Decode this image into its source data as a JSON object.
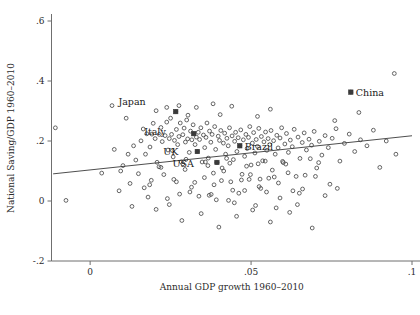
{
  "chart_data": {
    "type": "scatter",
    "title": "",
    "xlabel": "Annual GDP growth 1960–2010",
    "ylabel": "National Saving/GDP 1960–2010",
    "xlim": [
      -0.012,
      0.1
    ],
    "ylim": [
      -0.2,
      0.62
    ],
    "grid": false,
    "legend": "none",
    "xticks": [
      0,
      0.05,
      0.1
    ],
    "xtick_labels": [
      "0",
      ".05",
      ".1"
    ],
    "yticks": [
      -0.2,
      0,
      0.2,
      0.4,
      0.6
    ],
    "ytick_labels": [
      "-.2",
      "0",
      ".2",
      ".4",
      ".6"
    ],
    "marker_color": "#4a4a4a",
    "line_color": "#3a3a3a",
    "fit_line": {
      "x0": -0.0115,
      "y0": 0.0905,
      "x1": 0.1,
      "y1": 0.2175,
      "slope": 1.14,
      "intercept": 0.1036
    },
    "annotations": [
      {
        "label": "Japan",
        "x": 0.0266,
        "y": 0.298,
        "dx": -30,
        "dy": -10
      },
      {
        "label": "Italy",
        "x": 0.0322,
        "y": 0.2245,
        "dx": -28,
        "dy": -2
      },
      {
        "label": "UK",
        "x": 0.0333,
        "y": 0.165,
        "dx": -19,
        "dy": 0
      },
      {
        "label": "USA",
        "x": 0.0394,
        "y": 0.1285,
        "dx": -23,
        "dy": 2
      },
      {
        "label": "Brazil",
        "x": 0.0465,
        "y": 0.184,
        "dx": 5,
        "dy": 1
      },
      {
        "label": "China",
        "x": 0.081,
        "y": 0.363,
        "dx": 5,
        "dy": 1
      }
    ],
    "points": [
      [
        -0.0108,
        0.244
      ],
      [
        -0.0075,
        0.002
      ],
      [
        0.0036,
        0.093
      ],
      [
        0.0068,
        0.318
      ],
      [
        0.0075,
        0.172
      ],
      [
        0.009,
        0.034
      ],
      [
        0.0095,
        0.1
      ],
      [
        0.0112,
        0.276
      ],
      [
        0.0118,
        0.156
      ],
      [
        0.0124,
        0.0585
      ],
      [
        0.013,
        -0.018
      ],
      [
        0.0142,
        0.1365
      ],
      [
        0.015,
        0.091
      ],
      [
        0.0158,
        0.2005
      ],
      [
        0.0165,
        0.24
      ],
      [
        0.0172,
        0.156
      ],
      [
        0.018,
        0.013
      ],
      [
        0.0186,
        0.18
      ],
      [
        0.0192,
        0.223
      ],
      [
        0.0196,
        0.259
      ],
      [
        0.0202,
        0.208
      ],
      [
        0.0208,
        0.129
      ],
      [
        0.0215,
        0.222
      ],
      [
        0.022,
        0.245
      ],
      [
        0.0224,
        0.198
      ],
      [
        0.0229,
        0.088
      ],
      [
        0.0233,
        0.218
      ],
      [
        0.0238,
        0.263
      ],
      [
        0.0242,
        0.17
      ],
      [
        0.0246,
        0.208
      ],
      [
        0.025,
        0.276
      ],
      [
        0.0253,
        0.222
      ],
      [
        0.0258,
        0.147
      ],
      [
        0.0262,
        0.202
      ],
      [
        0.0266,
        0.298
      ],
      [
        0.0268,
        0.2385
      ],
      [
        0.0272,
        0.188
      ],
      [
        0.0276,
        0.215
      ],
      [
        0.028,
        0.26
      ],
      [
        0.0283,
        0.13
      ],
      [
        0.0288,
        0.221
      ],
      [
        0.0292,
        0.243
      ],
      [
        0.0296,
        0.1965
      ],
      [
        0.03,
        0.27
      ],
      [
        0.0303,
        0.207
      ],
      [
        0.0308,
        0.162
      ],
      [
        0.0312,
        0.233
      ],
      [
        0.0316,
        0.204
      ],
      [
        0.032,
        0.254
      ],
      [
        0.0322,
        0.2245
      ],
      [
        0.0326,
        0.188
      ],
      [
        0.033,
        0.213
      ],
      [
        0.0333,
        0.165
      ],
      [
        0.0336,
        0.229
      ],
      [
        0.034,
        0.205
      ],
      [
        0.0344,
        0.244
      ],
      [
        0.0348,
        0.13
      ],
      [
        0.0352,
        0.22
      ],
      [
        0.0356,
        0.178
      ],
      [
        0.036,
        0.212
      ],
      [
        0.0363,
        0.26
      ],
      [
        0.0367,
        0.143
      ],
      [
        0.0371,
        0.233
      ],
      [
        0.0375,
        0.196
      ],
      [
        0.0379,
        0.222
      ],
      [
        0.0383,
        0.093
      ],
      [
        0.0387,
        0.248
      ],
      [
        0.039,
        0.172
      ],
      [
        0.0394,
        0.1285
      ],
      [
        0.0398,
        0.216
      ],
      [
        0.0402,
        0.202
      ],
      [
        0.0406,
        0.235
      ],
      [
        0.041,
        0.11
      ],
      [
        0.0414,
        0.193
      ],
      [
        0.0418,
        0.226
      ],
      [
        0.0421,
        0.156
      ],
      [
        0.0425,
        0.209
      ],
      [
        0.0429,
        0.184
      ],
      [
        0.0433,
        0.244
      ],
      [
        0.0437,
        0.064
      ],
      [
        0.0441,
        0.217
      ],
      [
        0.0445,
        0.138
      ],
      [
        0.0449,
        0.199
      ],
      [
        0.0452,
        0.229
      ],
      [
        0.0456,
        0.165
      ],
      [
        0.046,
        0.211
      ],
      [
        0.0465,
        0.184
      ],
      [
        0.0468,
        0.237
      ],
      [
        0.0472,
        0.089
      ],
      [
        0.0476,
        0.204
      ],
      [
        0.048,
        0.149
      ],
      [
        0.0484,
        0.222
      ],
      [
        0.0488,
        0.175
      ],
      [
        0.0492,
        0.212
      ],
      [
        0.0496,
        0.248
      ],
      [
        0.05,
        0.12
      ],
      [
        0.0504,
        0.193
      ],
      [
        0.0508,
        0.228
      ],
      [
        0.0512,
        0.16
      ],
      [
        0.0516,
        0.205
      ],
      [
        0.052,
        0.182
      ],
      [
        0.0524,
        0.242
      ],
      [
        0.0528,
        0.073
      ],
      [
        0.0532,
        0.215
      ],
      [
        0.0536,
        0.134
      ],
      [
        0.054,
        0.197
      ],
      [
        0.0545,
        0.23
      ],
      [
        0.0549,
        0.169
      ],
      [
        0.0553,
        0.208
      ],
      [
        0.0558,
        0.188
      ],
      [
        0.0562,
        0.235
      ],
      [
        0.0566,
        0.103
      ],
      [
        0.057,
        0.201
      ],
      [
        0.0575,
        0.156
      ],
      [
        0.058,
        0.219
      ],
      [
        0.0584,
        0.177
      ],
      [
        0.059,
        0.21
      ],
      [
        0.0595,
        0.244
      ],
      [
        0.06,
        0.128
      ],
      [
        0.0605,
        0.19
      ],
      [
        0.061,
        0.225
      ],
      [
        0.0616,
        0.162
      ],
      [
        0.0622,
        0.203
      ],
      [
        0.0628,
        0.181
      ],
      [
        0.0634,
        0.239
      ],
      [
        0.064,
        0.082
      ],
      [
        0.0646,
        0.213
      ],
      [
        0.0652,
        0.142
      ],
      [
        0.0659,
        0.195
      ],
      [
        0.0665,
        0.227
      ],
      [
        0.0672,
        0.17
      ],
      [
        0.068,
        0.206
      ],
      [
        0.0688,
        0.186
      ],
      [
        0.0696,
        0.232
      ],
      [
        0.0704,
        0.11
      ],
      [
        0.0712,
        0.199
      ],
      [
        0.072,
        0.153
      ],
      [
        0.073,
        0.218
      ],
      [
        0.074,
        0.178
      ],
      [
        0.0752,
        0.209
      ],
      [
        0.0764,
        0.241
      ],
      [
        0.0776,
        0.133
      ],
      [
        0.079,
        0.192
      ],
      [
        0.0805,
        0.223
      ],
      [
        0.081,
        0.363
      ],
      [
        0.0822,
        0.165
      ],
      [
        0.084,
        0.204
      ],
      [
        0.086,
        0.184
      ],
      [
        0.088,
        0.236
      ],
      [
        0.09,
        0.112
      ],
      [
        0.092,
        0.2
      ],
      [
        0.0945,
        0.425
      ],
      [
        0.095,
        0.156
      ],
      [
        0.0168,
        0.044
      ],
      [
        0.0205,
        -0.028
      ],
      [
        0.024,
        0.008
      ],
      [
        0.0285,
        -0.065
      ],
      [
        0.031,
        0.03
      ],
      [
        0.0345,
        -0.042
      ],
      [
        0.037,
        0.019
      ],
      [
        0.04,
        -0.087
      ],
      [
        0.043,
        0.002
      ],
      [
        0.0455,
        -0.051
      ],
      [
        0.048,
        0.035
      ],
      [
        0.0505,
        -0.03
      ],
      [
        0.053,
        0.042
      ],
      [
        0.056,
        -0.07
      ],
      [
        0.059,
        0.01
      ],
      [
        0.062,
        -0.038
      ],
      [
        0.065,
        0.026
      ],
      [
        0.069,
        -0.09
      ],
      [
        0.073,
        0.018
      ],
      [
        0.026,
        0.072
      ],
      [
        0.0295,
        0.105
      ],
      [
        0.0315,
        0.046
      ],
      [
        0.0355,
        0.078
      ],
      [
        0.0385,
        0.054
      ],
      [
        0.0415,
        0.1
      ],
      [
        0.0443,
        0.036
      ],
      [
        0.047,
        0.07
      ],
      [
        0.0498,
        0.088
      ],
      [
        0.0525,
        0.048
      ],
      [
        0.0555,
        0.076
      ],
      [
        0.0585,
        0.06
      ],
      [
        0.0615,
        0.094
      ],
      [
        0.066,
        0.04
      ],
      [
        0.07,
        0.082
      ],
      [
        0.0745,
        0.056
      ],
      [
        0.0102,
        0.118
      ],
      [
        0.0135,
        0.184
      ],
      [
        0.0176,
        0.224
      ],
      [
        0.019,
        0.069
      ],
      [
        0.0214,
        0.114
      ],
      [
        0.0256,
        0.168
      ],
      [
        0.0278,
        0.023
      ],
      [
        0.0298,
        0.139
      ],
      [
        0.0338,
        0.016
      ],
      [
        0.0366,
        0.118
      ],
      [
        0.0392,
        0.004
      ],
      [
        0.0424,
        0.142
      ],
      [
        0.0448,
        -0.006
      ],
      [
        0.0486,
        0.116
      ],
      [
        0.0514,
        -0.015
      ],
      [
        0.0544,
        0.133
      ],
      [
        0.0578,
        -0.023
      ],
      [
        0.0608,
        0.123
      ],
      [
        0.0644,
        -0.012
      ],
      [
        0.0684,
        0.141
      ],
      [
        0.033,
        0.312
      ],
      [
        0.0382,
        0.324
      ],
      [
        0.0404,
        0.288
      ],
      [
        0.044,
        0.316
      ],
      [
        0.0276,
        0.318
      ],
      [
        0.0304,
        0.286
      ],
      [
        0.0238,
        0.312
      ],
      [
        0.052,
        0.282
      ],
      [
        0.056,
        0.306
      ],
      [
        0.0205,
        0.301
      ],
      [
        0.076,
        0.268
      ],
      [
        0.0835,
        0.295
      ],
      [
        0.0185,
        0.054
      ],
      [
        0.022,
        0.112
      ],
      [
        0.0246,
        -0.012
      ],
      [
        0.0268,
        0.064
      ],
      [
        0.0288,
        0.124
      ],
      [
        0.0325,
        0.062
      ],
      [
        0.0358,
        0.13
      ],
      [
        0.0376,
        0.022
      ],
      [
        0.0408,
        0.068
      ],
      [
        0.0434,
        0.126
      ],
      [
        0.0462,
        0.026
      ],
      [
        0.0494,
        0.072
      ],
      [
        0.0522,
        0.124
      ],
      [
        0.0548,
        0.03
      ],
      [
        0.0572,
        0.08
      ],
      [
        0.0598,
        0.132
      ],
      [
        0.063,
        0.034
      ],
      [
        0.0668,
        0.086
      ],
      [
        0.071,
        0.128
      ],
      [
        0.0768,
        0.042
      ]
    ]
  }
}
